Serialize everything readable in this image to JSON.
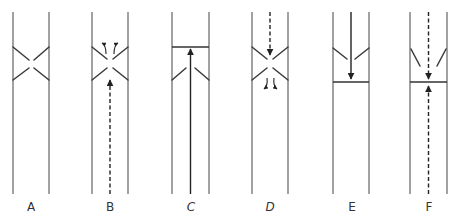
{
  "diagram": {
    "colors": {
      "wall": "#8a8a8a",
      "ink": "#222222",
      "background": "#ffffff"
    },
    "panels": [
      {
        "id": "A",
        "label": "A",
        "state": "valve open, no flow"
      },
      {
        "id": "B",
        "label": "B",
        "state": "dashed flow upward through open valve, curling at flaps"
      },
      {
        "id": "C",
        "label": "C",
        "state": "solid flow upward, flaps angled up, barrier above"
      },
      {
        "id": "D",
        "label": "D",
        "state": "dashed flow downward through open valve, curling below"
      },
      {
        "id": "E",
        "label": "E",
        "state": "solid flow downward, flaps angled down, barrier below"
      },
      {
        "id": "F",
        "label": "F",
        "state": "dashed flows meeting at barrier from above and below"
      }
    ]
  }
}
